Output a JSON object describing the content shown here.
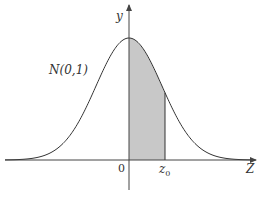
{
  "figure": {
    "type": "standard normal distribution curve with shaded area",
    "curve_label": "N(0,1)",
    "y_axis_label": "y",
    "x_axis_label": "Z",
    "origin_label": "0",
    "z0_label_main": "z",
    "z0_label_sub": "0",
    "caption": "",
    "colors": {
      "curve": "#333333",
      "axes": "#444444",
      "shade": "#c8c8c8"
    }
  },
  "chart_data": {
    "type": "area",
    "title": "",
    "series": [
      {
        "name": "N(0,1) density",
        "function": "standard normal pdf",
        "x_range": [
          -3.6,
          3.6
        ]
      }
    ],
    "shaded_region": {
      "from": 0,
      "to": "z0"
    },
    "annotations": [
      "N(0,1)",
      "0",
      "z0",
      "Z",
      "y"
    ],
    "xlabel": "Z",
    "ylabel": "y",
    "grid": false,
    "legend": "none"
  }
}
